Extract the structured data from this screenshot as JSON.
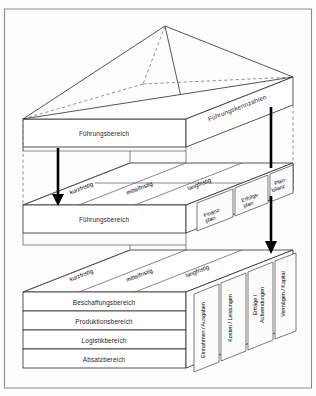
{
  "figure": {
    "apex_label": "",
    "top_block": {
      "face_label": "Führungsbereich",
      "side_label": "Führungskennzahlen"
    },
    "middle_block": {
      "face_label": "Führungsbereich",
      "time_labels": [
        "kurzfristig",
        "mittelfristig",
        "langfristig"
      ],
      "right_panels": [
        "Finanz-\nplan",
        "Erfolgs-\nplan",
        "Plan-\nbilanz"
      ],
      "right_panels_flat": [
        "Finanz-plan",
        "Erfolgs-plan",
        "Plan-bilanz"
      ],
      "right_panel_1_line1": "Finanz-",
      "right_panel_1_line2": "plan",
      "right_panel_2_line1": "Erfolgs-",
      "right_panel_2_line2": "plan",
      "right_panel_3_line1": "Plan-",
      "right_panel_3_line2": "bilanz"
    },
    "bottom_block": {
      "rows": [
        "Beschaffungsbereich",
        "Produktionsbereich",
        "Logistikbereich",
        "Absatzbereich"
      ],
      "time_labels": [
        "kurzfristig",
        "mittelfristig",
        "langfristig"
      ],
      "right_panels": [
        "Einnahmen / Ausgaben",
        "Kosten / Leistungen",
        "Erträge / Aufwendungen",
        "Vermögen / Kapital"
      ],
      "right_panel_3_line1": "Erträge /",
      "right_panel_3_line2": "Aufwendungen"
    },
    "arrows": [
      {
        "name": "left-down-arrow-upper"
      },
      {
        "name": "right-down-arrow-upper"
      },
      {
        "name": "right-down-arrow-lower"
      }
    ],
    "colors": {
      "stroke": "#2a2a2a",
      "dashed": "#7a7a7a",
      "arrow": "#000000",
      "background": "#fdfdfc",
      "frame": "#8d8d8d"
    }
  }
}
